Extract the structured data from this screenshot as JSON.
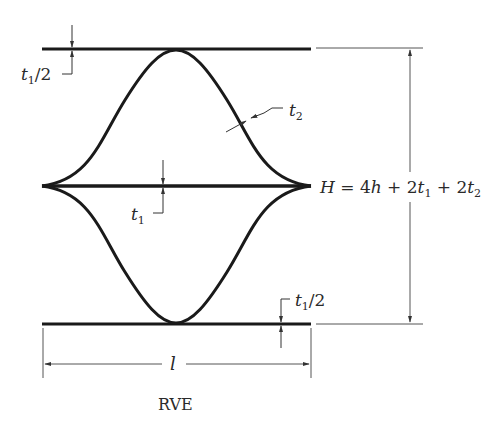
{
  "diagram": {
    "title": "RVE",
    "labels": {
      "top_half_thickness": {
        "base": "t",
        "sub": "1",
        "suffix": "/2"
      },
      "bottom_half_thickness": {
        "base": "t",
        "sub": "1",
        "suffix": "/2"
      },
      "center_thickness": {
        "base": "t",
        "sub": "1"
      },
      "curve_thickness": {
        "base": "t",
        "sub": "2"
      },
      "length": "l",
      "height_formula": {
        "lhs": "H",
        "eq": " = 4",
        "h": "h",
        "plus1": " + 2",
        "t1": "t",
        "t1_sub": "1",
        "plus2": " + 2",
        "t2": "t",
        "t2_sub": "2"
      }
    },
    "colors": {
      "line": "#1a1a1a",
      "dimension": "#555555",
      "text": "#2a2a2a",
      "background": "#ffffff"
    }
  }
}
